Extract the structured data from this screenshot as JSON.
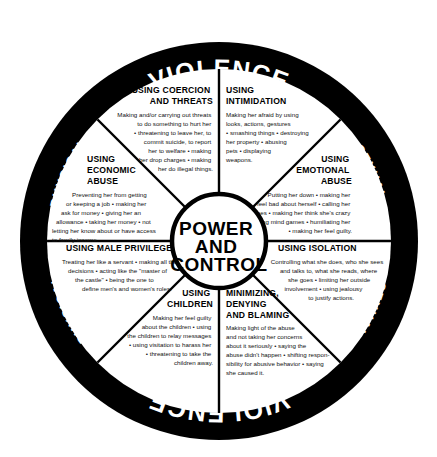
{
  "diagram": {
    "rim": {
      "top": {
        "left": "PHYSICAL",
        "center": "VIOLENCE",
        "right": "SEXUAL"
      },
      "bottom": {
        "left": "PHYSICAL",
        "center": "VIOLENCE",
        "right": "SEXUAL"
      }
    },
    "hub": {
      "line1": "POWER",
      "line2": "AND",
      "line3": "CONTROL"
    },
    "colors": {
      "rim": "#000000",
      "face": "#ffffff",
      "text": "#000000",
      "rim_text": "#ffffff"
    },
    "segments": [
      {
        "id": "coercion-and-threats",
        "title_lines": [
          "USING COERCION",
          "AND THREATS"
        ],
        "body_lines": [
          "Making and/or carrying out threats",
          "to do something to hurt her",
          "• threatening to leave her, to",
          "commit suicide, to report",
          "her to welfare • making",
          "her drop charges • making",
          "her do illegal things."
        ]
      },
      {
        "id": "intimidation",
        "title_lines": [
          "USING",
          "INTIMIDATION"
        ],
        "body_lines": [
          "Making her afraid by using",
          "looks, actions, gestures",
          "• smashing things • destroying",
          "her property • abusing",
          "pets • displaying",
          "weapons."
        ]
      },
      {
        "id": "emotional-abuse",
        "title_lines": [
          "USING",
          "EMOTIONAL",
          "ABUSE"
        ],
        "body_lines": [
          "Putting her down • making her",
          "feel bad about herself • calling her",
          "names • making her think she's crazy",
          "• playing mind games • humiliating her",
          "• making her feel guilty."
        ]
      },
      {
        "id": "isolation",
        "title_lines": [
          "USING ISOLATION"
        ],
        "body_lines": [
          "Controlling what she does, who she sees",
          "and talks to, what she reads, where",
          "she goes • limiting her outside",
          "involvement • using jealousy",
          "to justify actions."
        ]
      },
      {
        "id": "minimizing-denying-and-blaming",
        "title_lines": [
          "MINIMIZING,",
          "DENYING",
          "AND BLAMING"
        ],
        "body_lines": [
          "Making light of the abuse",
          "and not taking her concerns",
          "about it seriously • saying the",
          "abuse didn't happen • shifting respon-",
          "sibility for abusive behavior • saying",
          "she caused it."
        ]
      },
      {
        "id": "using-children",
        "title_lines": [
          "USING",
          "CHILDREN"
        ],
        "body_lines": [
          "Making her feel guilty",
          "about the children • using",
          "the children to relay messages",
          "• using visitation to harass her",
          "• threatening to take the",
          "children away."
        ]
      },
      {
        "id": "male-privilege",
        "title_lines": [
          "USING MALE PRIVILEGE"
        ],
        "body_lines": [
          "Treating her like a servant • making all the big",
          "decisions • acting like the \"master of",
          "the castle\" • being the one to",
          "define men's and women's roles."
        ]
      },
      {
        "id": "economic-abuse",
        "title_lines": [
          "USING",
          "ECONOMIC",
          "ABUSE"
        ],
        "body_lines": [
          "Preventing her from getting",
          "or keeping a job • making her",
          "ask for money • giving her an",
          "allowance • taking her money • not",
          "letting her know about or have access",
          "to family income."
        ]
      }
    ]
  }
}
